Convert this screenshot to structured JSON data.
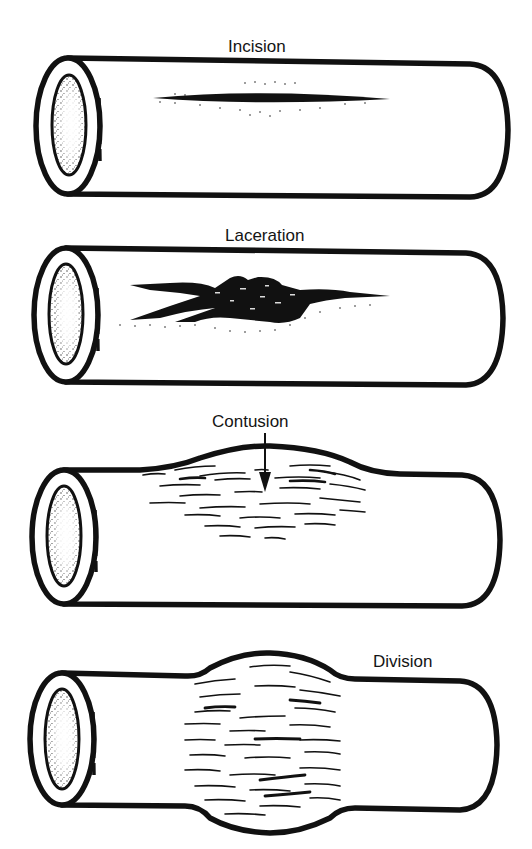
{
  "figure": {
    "panels": [
      {
        "id": "incision",
        "label": "Incision",
        "description": "Clean linear slit in vessel wall"
      },
      {
        "id": "laceration",
        "label": "Laceration",
        "description": "Irregular jagged tear in vessel wall"
      },
      {
        "id": "contusion",
        "label": "Contusion",
        "description": "Bruised, swollen wall segment with arrow pointing to injury"
      },
      {
        "id": "division",
        "label": "Division",
        "description": "Vessel bulging and stretched with fibrous disruption around the circumference"
      }
    ]
  },
  "colors": {
    "ink": "#111111",
    "background": "#ffffff"
  }
}
